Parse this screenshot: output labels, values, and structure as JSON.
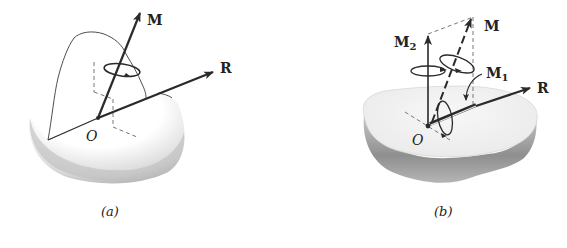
{
  "figure_a": {
    "caption": "(a)",
    "labels": {
      "moment": "M",
      "resultant": "R",
      "origin": "O"
    }
  },
  "figure_b": {
    "caption": "(b)",
    "labels": {
      "moment": "M",
      "moment_2": "M",
      "moment_2_sub": "2",
      "moment_1": "M",
      "moment_1_sub": "1",
      "resultant": "R",
      "origin": "O"
    }
  },
  "colors": {
    "ink": "#2a2a2a",
    "shade_dark": "#8a8a8a",
    "shade_light": "#e6e6e6",
    "background": "#ffffff"
  }
}
